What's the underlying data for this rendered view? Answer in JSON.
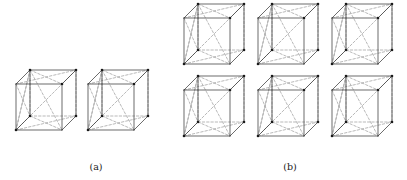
{
  "figure": {
    "background_color": "#ffffff",
    "edge_color": "#2b2b2b",
    "diagonal_color": "#9b9b9b",
    "vertex_color": "#1a1a1a",
    "panels": [
      {
        "id": "a",
        "caption": "(a)",
        "caption_x": 96,
        "caption_y": 170,
        "cube_count": 2,
        "layout": "1 row x 2 columns",
        "cubes": [
          {
            "name": "cube-a-1",
            "x": 16,
            "y": 70
          },
          {
            "name": "cube-a-2",
            "x": 88,
            "y": 70
          }
        ]
      },
      {
        "id": "b",
        "caption": "(b)",
        "caption_x": 290,
        "caption_y": 170,
        "cube_count": 6,
        "layout": "2 rows x 3 columns",
        "cubes": [
          {
            "name": "cube-b-1",
            "x": 184,
            "y": 4
          },
          {
            "name": "cube-b-2",
            "x": 258,
            "y": 4
          },
          {
            "name": "cube-b-3",
            "x": 332,
            "y": 4
          },
          {
            "name": "cube-b-4",
            "x": 184,
            "y": 76
          },
          {
            "name": "cube-b-5",
            "x": 258,
            "y": 76
          },
          {
            "name": "cube-b-6",
            "x": 332,
            "y": 76
          }
        ]
      }
    ],
    "cube_geometry": {
      "front_width": 46,
      "front_height": 46,
      "depth_dx": 14,
      "depth_dy": -14,
      "vertex_radius": 1.3,
      "marked_vertices": [
        "front-bottom-left",
        "back-top-left",
        "back-top-right",
        "front-top-left",
        "center-ish"
      ]
    }
  }
}
